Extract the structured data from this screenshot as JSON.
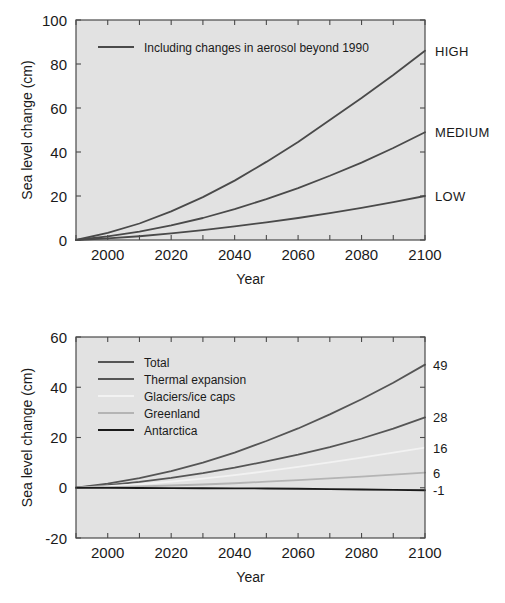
{
  "figure": {
    "background_color": "#ffffff",
    "plot_background_color": "#e2e2e2",
    "frame_color": "#4a4a4a"
  },
  "chart_data": [
    {
      "id": "top",
      "type": "line",
      "title": "",
      "xlabel": "Year",
      "ylabel": "Sea level change (cm)",
      "xlim": [
        1990,
        2100
      ],
      "ylim": [
        0,
        100
      ],
      "xticks": [
        2000,
        2020,
        2040,
        2060,
        2080,
        2100
      ],
      "xticklabels": [
        "2000",
        "2020",
        "2040",
        "2060",
        "2080",
        "2100"
      ],
      "minor_xtick_step": 10,
      "yticks": [
        0,
        20,
        40,
        60,
        80,
        100
      ],
      "yticklabels": [
        "0",
        "20",
        "40",
        "60",
        "80",
        "100"
      ],
      "grid": false,
      "legend_position": "upper-left",
      "legend_entries": [
        {
          "label": "Including changes in aerosol beyond 1990",
          "color": "#4a4a4a",
          "width": 1.8
        }
      ],
      "x": [
        1990,
        2000,
        2010,
        2020,
        2030,
        2040,
        2050,
        2060,
        2070,
        2080,
        2090,
        2100
      ],
      "series": [
        {
          "name": "HIGH",
          "color": "#4a4a4a",
          "width": 1.8,
          "values": [
            0,
            3.2,
            7.5,
            13.0,
            19.5,
            27.0,
            35.5,
            44.5,
            54.5,
            64.5,
            75.0,
            86.0
          ],
          "end_label": "HIGH",
          "end_value": 86
        },
        {
          "name": "MEDIUM",
          "color": "#4a4a4a",
          "width": 1.8,
          "values": [
            0,
            1.6,
            3.8,
            6.6,
            10.0,
            14.0,
            18.6,
            23.6,
            29.2,
            35.2,
            41.8,
            49.0
          ],
          "end_label": "MEDIUM",
          "end_value": 49
        },
        {
          "name": "LOW",
          "color": "#4a4a4a",
          "width": 1.8,
          "values": [
            0,
            0.7,
            1.7,
            3.0,
            4.5,
            6.2,
            8.0,
            10.0,
            12.2,
            14.6,
            17.2,
            20.0
          ],
          "end_label": "LOW",
          "end_value": 20
        }
      ]
    },
    {
      "id": "bottom",
      "type": "line",
      "title": "",
      "xlabel": "Year",
      "ylabel": "Sea level change (cm)",
      "xlim": [
        1990,
        2100
      ],
      "ylim": [
        -20,
        60
      ],
      "xticks": [
        2000,
        2020,
        2040,
        2060,
        2080,
        2100
      ],
      "xticklabels": [
        "2000",
        "2020",
        "2040",
        "2060",
        "2080",
        "2100"
      ],
      "minor_xtick_step": 10,
      "yticks": [
        -20,
        0,
        20,
        40,
        60
      ],
      "yticklabels": [
        "-20",
        "0",
        "20",
        "40",
        "60"
      ],
      "grid": false,
      "legend_position": "upper-left",
      "x": [
        1990,
        2000,
        2010,
        2020,
        2030,
        2040,
        2050,
        2060,
        2070,
        2080,
        2090,
        2100
      ],
      "series": [
        {
          "name": "Total",
          "color": "#555555",
          "width": 1.8,
          "values": [
            0,
            1.6,
            3.8,
            6.6,
            10.0,
            14.0,
            18.6,
            23.6,
            29.2,
            35.2,
            41.8,
            49.0
          ],
          "end_value": 49,
          "end_label": "49"
        },
        {
          "name": "Thermal expansion",
          "color": "#555555",
          "width": 1.8,
          "values": [
            0,
            1.0,
            2.3,
            3.9,
            5.8,
            8.0,
            10.5,
            13.2,
            16.2,
            19.6,
            23.5,
            28.0
          ],
          "end_value": 28,
          "end_label": "28"
        },
        {
          "name": "Glaciers/ice caps",
          "color": "#f2f2f2",
          "width": 1.8,
          "values": [
            0,
            0.6,
            1.4,
            2.4,
            3.6,
            5.0,
            6.6,
            8.3,
            10.1,
            12.0,
            14.0,
            16.0
          ],
          "end_value": 16,
          "end_label": "16"
        },
        {
          "name": "Greenland",
          "color": "#b4b4b4",
          "width": 1.8,
          "values": [
            0,
            0.2,
            0.5,
            0.9,
            1.3,
            1.8,
            2.4,
            3.0,
            3.7,
            4.4,
            5.2,
            6.0
          ],
          "end_value": 6,
          "end_label": "6"
        },
        {
          "name": "Antarctica",
          "color": "#1a1a1a",
          "width": 1.8,
          "values": [
            0,
            -0.05,
            -0.1,
            -0.15,
            -0.2,
            -0.25,
            -0.3,
            -0.4,
            -0.55,
            -0.7,
            -0.85,
            -1.0
          ],
          "end_value": -1,
          "end_label": "-1"
        }
      ]
    }
  ]
}
